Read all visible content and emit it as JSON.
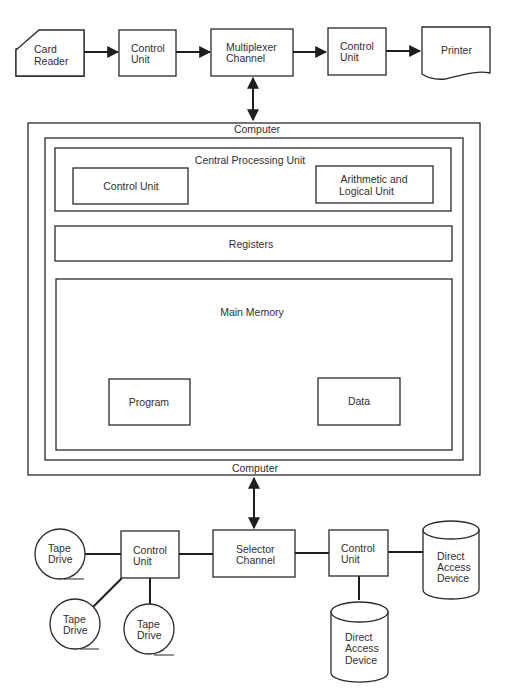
{
  "top_row": {
    "card_reader": [
      "Card",
      "Reader"
    ],
    "control_unit_1": [
      "Control",
      "Unit"
    ],
    "multiplexer_channel": [
      "Multiplexer",
      "Channel"
    ],
    "control_unit_2": [
      "Control",
      "Unit"
    ],
    "printer": "Printer"
  },
  "computer": {
    "label_top": "Computer",
    "label_bottom": "Computer",
    "cpu": {
      "title": "Central Processing Unit",
      "control_unit": "Control Unit",
      "alu": [
        "Arithmetic and",
        "Logical Unit"
      ]
    },
    "registers": "Registers",
    "main_memory": {
      "title": "Main Memory",
      "program": "Program",
      "data": "Data"
    }
  },
  "bottom_row": {
    "tape_drive_1": [
      "Tape",
      "Drive"
    ],
    "tape_drive_2": [
      "Tape",
      "Drive"
    ],
    "tape_drive_3": [
      "Tape",
      "Drive"
    ],
    "control_unit_3": [
      "Control",
      "Unit"
    ],
    "selector_channel": [
      "Selector",
      "Channel"
    ],
    "control_unit_4": [
      "Control",
      "Unit"
    ],
    "direct_access_1": [
      "Direct",
      "Access",
      "Device"
    ],
    "direct_access_2": [
      "Direct",
      "Access",
      "Device"
    ]
  }
}
